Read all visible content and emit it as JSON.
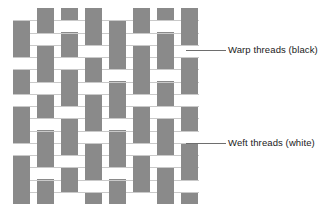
{
  "diagram": {
    "type": "woven-textile-cross-section",
    "colors": {
      "warp": "#8a8a8a",
      "weft": "#ffffff",
      "background": "#ffffff",
      "grid_line": "#c9c9c9",
      "leader_line": "#6e6e6e",
      "text": "#1a1a1a"
    },
    "weave_area": {
      "x": 13,
      "y": 8,
      "width": 186,
      "height": 196,
      "columns": 8,
      "rows": 16,
      "column_width": 17,
      "column_gap": 7,
      "row_height": 12.25
    },
    "warp_columns": [
      {
        "index": 0,
        "x": 13,
        "width": 17,
        "gaps": [
          [
            0,
            0
          ],
          [
            4,
            4
          ],
          [
            7,
            7
          ],
          [
            11,
            11
          ]
        ]
      },
      {
        "index": 1,
        "x": 37,
        "width": 17,
        "gaps": [
          [
            2,
            2
          ],
          [
            6,
            6
          ],
          [
            9,
            9
          ],
          [
            13,
            13
          ]
        ]
      },
      {
        "index": 2,
        "x": 61,
        "width": 17,
        "gaps": [
          [
            1,
            1
          ],
          [
            4,
            4
          ],
          [
            8,
            8
          ],
          [
            12,
            12
          ],
          [
            15,
            15
          ]
        ]
      },
      {
        "index": 3,
        "x": 85,
        "width": 17,
        "gaps": [
          [
            3,
            3
          ],
          [
            6,
            6
          ],
          [
            10,
            10
          ],
          [
            14,
            14
          ]
        ]
      },
      {
        "index": 4,
        "x": 109,
        "width": 17,
        "gaps": [
          [
            0,
            0
          ],
          [
            5,
            5
          ],
          [
            9,
            9
          ],
          [
            13,
            13
          ]
        ]
      },
      {
        "index": 5,
        "x": 133,
        "width": 17,
        "gaps": [
          [
            2,
            2
          ],
          [
            7,
            7
          ],
          [
            11,
            11
          ],
          [
            15,
            15
          ]
        ]
      },
      {
        "index": 6,
        "x": 157,
        "width": 17,
        "gaps": [
          [
            1,
            1
          ],
          [
            5,
            5
          ],
          [
            8,
            8
          ],
          [
            12,
            12
          ]
        ]
      },
      {
        "index": 7,
        "x": 181,
        "width": 17,
        "gaps": [
          [
            3,
            3
          ],
          [
            7,
            7
          ],
          [
            10,
            10
          ],
          [
            14,
            14
          ]
        ]
      }
    ],
    "callouts": [
      {
        "id": "warp-callout",
        "label": "Warp threads (black)",
        "label_x": 228,
        "label_y": 44,
        "leader_x": 186,
        "leader_y": 50,
        "leader_length": 40
      },
      {
        "id": "weft-callout",
        "label": "Weft threads (white)",
        "label_x": 228,
        "label_y": 137,
        "leader_x": 186,
        "leader_y": 143,
        "leader_length": 40
      }
    ]
  }
}
